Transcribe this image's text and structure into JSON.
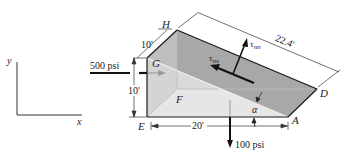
{
  "diagram": {
    "type": "stress-wedge",
    "axes": {
      "y_label": "y",
      "x_label": "x"
    },
    "vertices": {
      "H": "H",
      "G": "G",
      "F": "F",
      "E": "E",
      "A": "A",
      "D": "D"
    },
    "dimensions": {
      "depth": "10'",
      "height": "10'",
      "base": "20'",
      "hypotenuse": "22.4'"
    },
    "loads": {
      "horizontal": "500 psi",
      "vertical": "100 psi"
    },
    "stress_labels": {
      "normal": "τnn",
      "normal_sym": "τ",
      "normal_sub": "nn",
      "shear_sym": "τ",
      "shear_sub": "ns"
    },
    "angle_label": "α",
    "colors": {
      "top_face": "#a9a9a9",
      "front_face": "#d6d6d6",
      "side_face": "#e4e4e4",
      "lines": "#1a1a1a"
    }
  }
}
